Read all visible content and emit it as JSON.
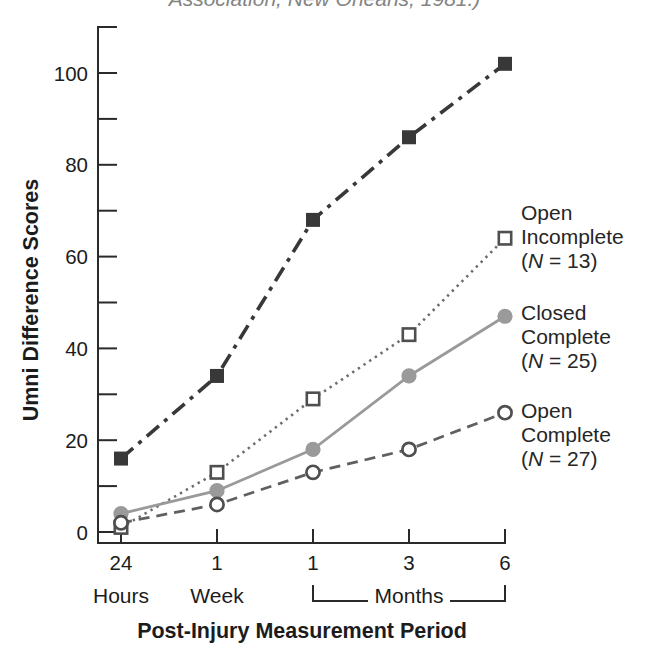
{
  "caption": "Association, New Orleans, 1981.)",
  "chart_data": {
    "type": "line",
    "title": "",
    "xlabel": "Post-Injury Measurement Period",
    "ylabel": "Umni Difference Scores",
    "x_categories": [
      "24 Hours",
      "1 Week",
      "1 Month",
      "3 Months",
      "6 Months"
    ],
    "x_tick_numbers": [
      "24",
      "1",
      "1",
      "3",
      "6"
    ],
    "x_unit_labels": {
      "hours": "Hours",
      "week": "Week",
      "months_bracket": "Months"
    },
    "y_labeled_ticks": [
      100,
      80,
      60,
      40,
      20,
      0
    ],
    "y_minor_ticks": [
      90,
      70,
      50,
      30,
      10
    ],
    "ylim": [
      0,
      110
    ],
    "grid": false,
    "legend_position": "right-of-last-points",
    "series": [
      {
        "name": "",
        "label_lines": [],
        "n_label": "",
        "marker": "filled-square",
        "line": "dash-dot",
        "color": "#383838",
        "values": [
          16,
          34,
          68,
          86,
          102
        ]
      },
      {
        "name": "Open Incomplete",
        "label_lines": [
          "Open",
          "Incomplete"
        ],
        "n_label": "(N = 13)",
        "marker": "open-square",
        "line": "dotted",
        "color": "#6e6e6e",
        "values": [
          1,
          13,
          29,
          43,
          64
        ]
      },
      {
        "name": "Closed Complete",
        "label_lines": [
          "Closed",
          "Complete"
        ],
        "n_label": "(N = 25)",
        "marker": "filled-circle",
        "line": "solid",
        "color": "#9a9a9a",
        "values": [
          4,
          9,
          18,
          34,
          47
        ]
      },
      {
        "name": "Open Complete",
        "label_lines": [
          "Open",
          "Complete"
        ],
        "n_label": "(N = 27)",
        "marker": "open-circle",
        "line": "dashed",
        "color": "#606060",
        "values": [
          2,
          6,
          13,
          18,
          26
        ]
      }
    ]
  }
}
